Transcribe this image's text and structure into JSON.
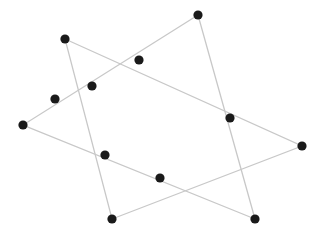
{
  "diagram": {
    "type": "two overlapping triangles with points",
    "width": 322,
    "height": 239,
    "background": "#ffffff",
    "line_color": "#c8c8c8",
    "point_color": "#1a1a1a",
    "triangles": [
      {
        "name": "triangle-a",
        "vertices": [
          [
            65,
            39
          ],
          [
            302,
            146
          ],
          [
            112,
            219
          ]
        ]
      },
      {
        "name": "triangle-b",
        "vertices": [
          [
            198,
            15
          ],
          [
            23,
            125
          ],
          [
            255,
            219
          ]
        ]
      }
    ],
    "points": [
      {
        "x": 198,
        "y": 15
      },
      {
        "x": 65,
        "y": 39
      },
      {
        "x": 139,
        "y": 60
      },
      {
        "x": 92,
        "y": 86
      },
      {
        "x": 55,
        "y": 99
      },
      {
        "x": 23,
        "y": 125
      },
      {
        "x": 230,
        "y": 118
      },
      {
        "x": 302,
        "y": 146
      },
      {
        "x": 105,
        "y": 155
      },
      {
        "x": 160,
        "y": 178
      },
      {
        "x": 112,
        "y": 219
      },
      {
        "x": 255,
        "y": 219
      }
    ]
  }
}
